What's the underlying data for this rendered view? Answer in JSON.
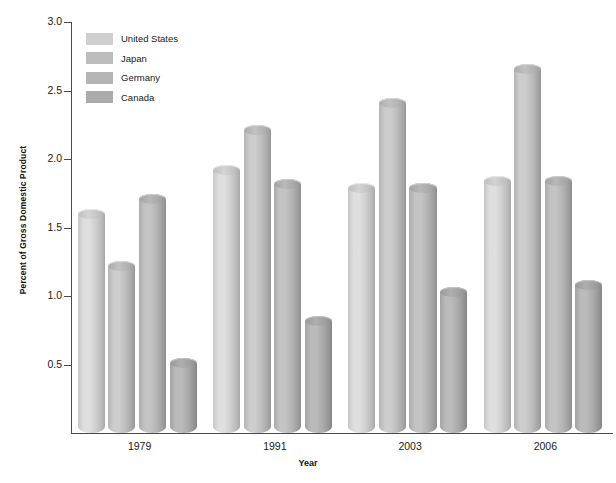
{
  "chart_data": {
    "type": "bar",
    "title": "",
    "subtitle": "",
    "xlabel": "Year",
    "ylabel": "Percent of Gross Domestic Product",
    "categories": [
      "1979",
      "1991",
      "2003",
      "2006"
    ],
    "series": [
      {
        "name": "United States",
        "color": "#cfcfcf",
        "values": [
          1.6,
          1.92,
          1.79,
          1.84
        ]
      },
      {
        "name": "Japan",
        "color": "#bdbdbd",
        "values": [
          1.22,
          2.21,
          2.41,
          2.66
        ]
      },
      {
        "name": "Germany",
        "color": "#b4b4b4",
        "values": [
          1.71,
          1.82,
          1.79,
          1.84
        ]
      },
      {
        "name": "Canada",
        "color": "#ababab",
        "values": [
          0.51,
          0.82,
          1.03,
          1.08
        ]
      }
    ],
    "ylim": [
      0,
      3.0
    ],
    "yticks": [
      "0.5",
      "1.0",
      "1.5",
      "2.0",
      "2.5",
      "3.0"
    ],
    "ytick_values": [
      0.5,
      1.0,
      1.5,
      2.0,
      2.5,
      3.0
    ],
    "grid": false,
    "legend_position": "top-left",
    "bar_style": "cylinder-3d",
    "axis_color": "#4a4a4a",
    "background_color": "#ffffff"
  },
  "legend": {
    "items": [
      {
        "label": "United States",
        "color": "#cfcfcf"
      },
      {
        "label": "Japan",
        "color": "#bdbdbd"
      },
      {
        "label": "Germany",
        "color": "#b4b4b4"
      },
      {
        "label": "Canada",
        "color": "#ababab"
      }
    ]
  },
  "axes": {
    "y_title": "Percent of Gross Domestic Product",
    "x_title": "Year"
  }
}
